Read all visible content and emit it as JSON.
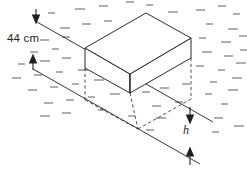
{
  "figure": {
    "type": "geometry-diagram",
    "labels": {
      "depth_above": "44 cm",
      "height_below": "h"
    },
    "colors": {
      "stroke": "#231f20",
      "water_mark": "#6d6e71",
      "background": "#ffffff"
    },
    "chart_data": {
      "type": "diagram",
      "title": "",
      "annotations": [
        {
          "name": "depth-above-water",
          "text": "44 cm",
          "unit": "cm",
          "value": 44
        },
        {
          "name": "height-below-water",
          "text": "h",
          "unit": "",
          "value": null
        }
      ]
    },
    "geometry": {
      "box_top_face": "85,48 146,13 191,38 130,74",
      "box_front_left_edge": "85,48 85,68",
      "box_front_bottom": "85,68 130,93",
      "box_right_bottom": "130,93 191,58",
      "box_right_edge": "191,38 191,58",
      "box_front_center_edge": "130,74 130,93",
      "water_line_upper": "37,22 213,122",
      "water_line_lower": "33,69 200,164",
      "hidden_edges": [
        "85,68 85,100",
        "85,100 138,129",
        "138,129 191,99",
        "191,58 191,99",
        "130,93 138,129"
      ]
    },
    "arrows": {
      "top_down": {
        "x": 36,
        "y1": 9,
        "y2": 22
      },
      "upper_up": {
        "x": 33,
        "y1": 69,
        "y2": 56
      },
      "h_down": {
        "x": 190,
        "y1": 108,
        "y2": 122
      },
      "h_up": {
        "x": 190,
        "y1": 164,
        "y2": 150
      }
    },
    "water_marks": [
      [
        48,
        13
      ],
      [
        75,
        9
      ],
      [
        99,
        6
      ],
      [
        126,
        2
      ],
      [
        146,
        5
      ],
      [
        168,
        12
      ],
      [
        196,
        10
      ],
      [
        218,
        6
      ],
      [
        233,
        14
      ],
      [
        60,
        28
      ],
      [
        82,
        24
      ],
      [
        104,
        21
      ],
      [
        206,
        24
      ],
      [
        228,
        29
      ],
      [
        40,
        40
      ],
      [
        62,
        37
      ],
      [
        199,
        38
      ],
      [
        221,
        42
      ],
      [
        239,
        36
      ],
      [
        30,
        52
      ],
      [
        52,
        49
      ],
      [
        202,
        52
      ],
      [
        224,
        56
      ],
      [
        240,
        50
      ],
      [
        18,
        64
      ],
      [
        40,
        61
      ],
      [
        62,
        58
      ],
      [
        196,
        66
      ],
      [
        218,
        70
      ],
      [
        236,
        63
      ],
      [
        12,
        78
      ],
      [
        34,
        75
      ],
      [
        56,
        72
      ],
      [
        78,
        70
      ],
      [
        160,
        88
      ],
      [
        182,
        84
      ],
      [
        210,
        82
      ],
      [
        232,
        78
      ],
      [
        28,
        90
      ],
      [
        50,
        87
      ],
      [
        72,
        84
      ],
      [
        94,
        80
      ],
      [
        116,
        77
      ],
      [
        142,
        92
      ],
      [
        205,
        94
      ],
      [
        228,
        90
      ],
      [
        44,
        103
      ],
      [
        66,
        100
      ],
      [
        88,
        97
      ],
      [
        110,
        94
      ],
      [
        152,
        106
      ],
      [
        175,
        102
      ],
      [
        221,
        104
      ],
      [
        40,
        116
      ],
      [
        62,
        113
      ],
      [
        98,
        110
      ],
      [
        128,
        116
      ],
      [
        156,
        118
      ],
      [
        214,
        118
      ],
      [
        146,
        130
      ],
      [
        212,
        132
      ],
      [
        234,
        126
      ]
    ]
  }
}
